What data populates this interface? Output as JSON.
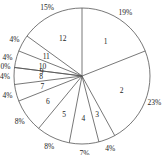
{
  "chart_data": {
    "type": "pie",
    "title": "",
    "start_angle_deg": 90,
    "direction": "clockwise",
    "categories": [
      "1",
      "2",
      "3",
      "4",
      "5",
      "6",
      "7",
      "8",
      "9",
      "10",
      "11",
      "12"
    ],
    "values": [
      19,
      23,
      4,
      7,
      8,
      8,
      4,
      4,
      0,
      4,
      4,
      15
    ],
    "percent_labels": [
      "19%",
      "23%",
      "4%",
      "7%",
      "8%",
      "8%",
      "4%",
      "4%",
      "0%",
      "4%",
      "4%",
      "15%"
    ],
    "fill_color": "#ffffff",
    "edge_color": "#555555"
  }
}
